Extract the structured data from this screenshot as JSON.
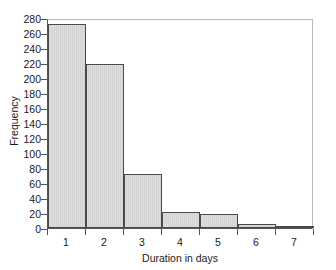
{
  "chart_data": {
    "type": "bar",
    "title": "",
    "subtitle": "",
    "xlabel": "Duration in days",
    "ylabel": "Frequency",
    "categories": [
      "1",
      "2",
      "3",
      "4",
      "5",
      "6",
      "7"
    ],
    "values": [
      272,
      219,
      72,
      22,
      19,
      5,
      1
    ],
    "series": [
      {
        "name": "Frequency",
        "values": [
          272,
          219,
          72,
          22,
          19,
          5,
          1
        ]
      }
    ],
    "xlim": [
      0.5,
      7.5
    ],
    "ylim": [
      0,
      280
    ],
    "ytick_labels": [
      "0",
      "20",
      "40",
      "60",
      "80",
      "100",
      "120",
      "140",
      "160",
      "180",
      "200",
      "220",
      "240",
      "260",
      "280"
    ],
    "ytick_values": [
      0,
      20,
      40,
      60,
      80,
      100,
      120,
      140,
      160,
      180,
      200,
      220,
      240,
      260,
      280
    ],
    "xtick_labels": [
      "1",
      "2",
      "3",
      "4",
      "5",
      "6",
      "7"
    ],
    "grid": false,
    "legend": false,
    "legend_position": "none",
    "bar_fill_color": "#dcdcdc",
    "bar_edge_color": "#4a4a4a",
    "axis_color": "#555555",
    "text_color": "#1a1a1a",
    "background_color": "#ffffff"
  }
}
